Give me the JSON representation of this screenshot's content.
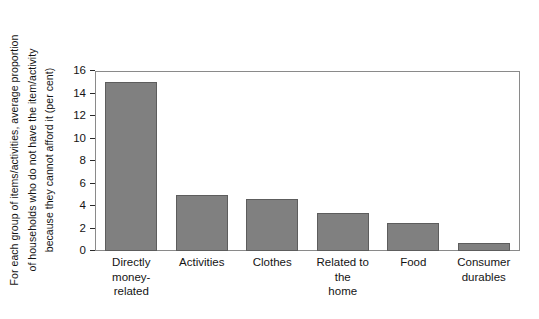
{
  "chart_data": {
    "type": "bar",
    "title": "",
    "xlabel": "",
    "ylabel": "For each group of items/activities, average proportion of households who do not have the item/activity because they cannot afford it (per cent)",
    "ylabel_lines": [
      "For each group of items/activities, average proportion",
      "of households who do not have the item/activity",
      "because they cannot afford it (per cent)"
    ],
    "categories": [
      "Directly money-related",
      "Activities",
      "Clothes",
      "Related to the home",
      "Food",
      "Consumer durables"
    ],
    "category_lines": [
      [
        "Directly",
        "money-related"
      ],
      [
        "Activities"
      ],
      [
        "Clothes"
      ],
      [
        "Related to the",
        "home"
      ],
      [
        "Food"
      ],
      [
        "Consumer",
        "durables"
      ]
    ],
    "values": [
      15.0,
      5.0,
      4.6,
      3.4,
      2.5,
      0.7
    ],
    "ylim": [
      0,
      16
    ],
    "ytick_values": [
      0,
      2,
      4,
      6,
      8,
      10,
      12,
      14,
      16
    ],
    "ytick_labels": [
      "0",
      "2",
      "4",
      "6",
      "8",
      "10",
      "12",
      "14",
      "16"
    ],
    "grid": false,
    "legend": null,
    "bar_color": "#808080",
    "bar_edge_color": "#5d5d5d",
    "frame_color": "#8a8a8a",
    "background_color": "#ffffff"
  }
}
